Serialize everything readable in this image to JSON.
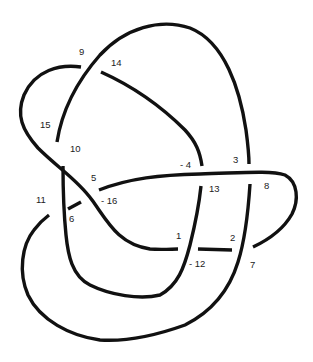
{
  "diagram": {
    "type": "knot-diagram",
    "stroke_color": "#111111",
    "background": "#ffffff",
    "labels": [
      {
        "id": "l9",
        "text": "9",
        "x": 79,
        "y": 47
      },
      {
        "id": "l14",
        "text": "14",
        "x": 111,
        "y": 58
      },
      {
        "id": "l15",
        "text": "15",
        "x": 40,
        "y": 120
      },
      {
        "id": "l10",
        "text": "10",
        "x": 70,
        "y": 144
      },
      {
        "id": "l5",
        "text": "5",
        "x": 91,
        "y": 173
      },
      {
        "id": "lm16",
        "text": "- 16",
        "x": 101,
        "y": 196
      },
      {
        "id": "l11",
        "text": "11",
        "x": 36,
        "y": 195
      },
      {
        "id": "l6",
        "text": "6",
        "x": 69,
        "y": 214
      },
      {
        "id": "lm4",
        "text": "- 4",
        "x": 180,
        "y": 160
      },
      {
        "id": "l3",
        "text": "3",
        "x": 233,
        "y": 155
      },
      {
        "id": "l13",
        "text": "13",
        "x": 209,
        "y": 184
      },
      {
        "id": "l8",
        "text": "8",
        "x": 264,
        "y": 181
      },
      {
        "id": "l1",
        "text": "1",
        "x": 176,
        "y": 231
      },
      {
        "id": "l2",
        "text": "2",
        "x": 230,
        "y": 233
      },
      {
        "id": "lm12",
        "text": "- 12",
        "x": 189,
        "y": 259
      },
      {
        "id": "l7",
        "text": "7",
        "x": 250,
        "y": 260
      }
    ]
  }
}
